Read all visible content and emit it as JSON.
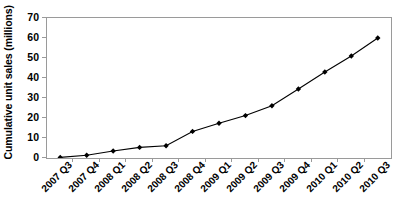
{
  "chart_data": {
    "type": "line",
    "title": "",
    "xlabel": "",
    "ylabel": "Cumulative unit sales (millions)",
    "categories": [
      "2007 Q3",
      "2007 Q4",
      "2008 Q1",
      "2008 Q2",
      "2008 Q3",
      "2008 Q4",
      "2009 Q1",
      "2009 Q2",
      "2009 Q3",
      "2009 Q4",
      "2010 Q1",
      "2010 Q2",
      "2010 Q3"
    ],
    "values": [
      0.3,
      1.4,
      3.5,
      5.3,
      6.1,
      13.3,
      17.4,
      21.2,
      26.1,
      34.5,
      43.0,
      51.0,
      60.0
    ],
    "ylim": [
      0,
      70
    ],
    "yticks": [
      0,
      10,
      20,
      30,
      40,
      50,
      60,
      70
    ],
    "ytick_labels": [
      "0",
      "10",
      "20",
      "30",
      "40",
      "50",
      "60",
      "70"
    ],
    "grid": false,
    "legend": "none",
    "marker": "diamond",
    "line_color": "#000000",
    "marker_color": "#000000",
    "axis_color": "#9a9a9a",
    "plot_background": "#ffffff"
  }
}
